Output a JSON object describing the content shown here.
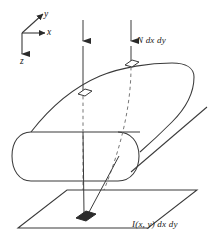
{
  "figure": {
    "kind": "3d-line-diagram",
    "background_color": "#ffffff",
    "stroke_color": "#3a3a3a",
    "dash_color": "#777777",
    "fill_color": "#2b2b2b"
  },
  "axes": {
    "name": "coordinate-triad",
    "origin": {
      "x": 22,
      "y": 33
    },
    "labels": {
      "y": "y",
      "x": "x",
      "z": "z"
    },
    "directions": {
      "y": "up-right",
      "x": "right",
      "z": "down"
    }
  },
  "arrows": [
    {
      "name": "incident-ray-left",
      "label": "",
      "x": 83,
      "y_start": 20,
      "y_arrow": 43,
      "y_end": 92
    },
    {
      "name": "incident-ray-right",
      "label": "N dx dy",
      "x": 131,
      "y_start": 20,
      "y_arrow": 43,
      "y_end": 62
    }
  ],
  "labels": {
    "flux": "N dx dy",
    "irradiance": "I(x, y) dx dy"
  },
  "patches": [
    {
      "name": "surface-patch-front",
      "cx": 84,
      "cy": 93
    },
    {
      "name": "surface-patch-back",
      "cx": 131,
      "cy": 64
    },
    {
      "name": "plane-patch",
      "cx": 85,
      "cy": 216,
      "filled": true
    }
  ],
  "plane": {
    "name": "detector-plane",
    "corners": [
      {
        "x": 18,
        "y": 228
      },
      {
        "x": 67,
        "y": 190
      },
      {
        "x": 197,
        "y": 190
      },
      {
        "x": 148,
        "y": 228
      }
    ]
  }
}
